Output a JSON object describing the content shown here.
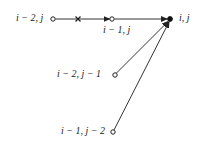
{
  "diagram": {
    "title": "",
    "stroke_color": "#333333",
    "background": "#ffffff",
    "nodes": [
      {
        "id": "n_im2_j",
        "label": "i − 2, j",
        "type": "open-circle",
        "x": 53,
        "y": 19
      },
      {
        "id": "n_im1_j",
        "label": "i − 1, j",
        "type": "open-circle",
        "x": 112,
        "y": 19
      },
      {
        "id": "n_i_j",
        "label": "i, j",
        "type": "filled-circle",
        "x": 170,
        "y": 19
      },
      {
        "id": "n_im2_jm1",
        "label": "i − 2, j − 1",
        "type": "open-circle",
        "x": 115,
        "y": 75
      },
      {
        "id": "n_im1_jm2",
        "label": "i − 1, j − 2",
        "type": "open-circle",
        "x": 113,
        "y": 132
      }
    ],
    "edges": [
      {
        "from": "n_im2_j",
        "to": "n_im1_j",
        "arrow": true,
        "marker": "cross",
        "marker_x": 78
      },
      {
        "from": "n_im1_j",
        "to": "n_i_j",
        "arrow": true
      },
      {
        "from": "n_im2_jm1",
        "to": "n_i_j",
        "arrow": true
      },
      {
        "from": "n_im1_jm2",
        "to": "n_i_j",
        "arrow": true
      }
    ],
    "labels": {
      "im2_j": "i − 2, j",
      "im1_j": "i − 1, j",
      "i_j": "i, j",
      "im2_jm1": "i − 2, j − 1",
      "im1_jm2": "i − 1, j − 2"
    }
  }
}
